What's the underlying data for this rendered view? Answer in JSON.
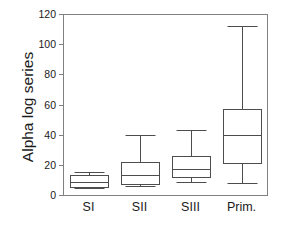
{
  "chart_data": {
    "type": "box",
    "title": "",
    "xlabel": "",
    "ylabel": "Alpha log series",
    "ylim": [
      0,
      120
    ],
    "yticks": [
      0,
      20,
      40,
      60,
      80,
      100,
      120
    ],
    "ytick_labels": [
      "0",
      "20",
      "40",
      "60",
      "80",
      "100",
      "120"
    ],
    "grid": false,
    "legend": false,
    "categories": [
      "SI",
      "SII",
      "SIII",
      "Prim."
    ],
    "boxes": [
      {
        "label": "SI",
        "whisker_low": 4.5,
        "q1": 5.5,
        "median": 8.5,
        "q3": 13.0,
        "whisker_high": 15.5
      },
      {
        "label": "SII",
        "whisker_low": 6.0,
        "q1": 7.0,
        "median": 13.0,
        "q3": 22.0,
        "whisker_high": 40.0
      },
      {
        "label": "SIII",
        "whisker_low": 8.5,
        "q1": 12.0,
        "median": 17.0,
        "q3": 26.0,
        "whisker_high": 43.0
      },
      {
        "label": "Prim.",
        "whisker_low": 8.0,
        "q1": 21.0,
        "median": 40.0,
        "q3": 57.0,
        "whisker_high": 112.0
      }
    ],
    "colors": {
      "line": "#4d4d4d",
      "frame": "#808080",
      "text": "#1a1a1a",
      "background": "#ffffff"
    }
  }
}
